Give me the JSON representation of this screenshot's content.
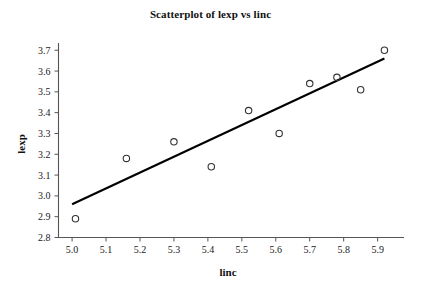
{
  "chart_data": {
    "type": "scatter",
    "title": "Scatterplot of lexp vs linc",
    "xlabel": "linc",
    "ylabel": "lexp",
    "xlim": [
      4.96,
      5.96
    ],
    "ylim": [
      2.8,
      3.73
    ],
    "grid": false,
    "legend": null,
    "xticks": [
      "5.0",
      "5.1",
      "5.2",
      "5.3",
      "5.4",
      "5.5",
      "5.6",
      "5.7",
      "5.8",
      "5.9"
    ],
    "xtick_values": [
      5.0,
      5.1,
      5.2,
      5.3,
      5.4,
      5.5,
      5.6,
      5.7,
      5.8,
      5.9
    ],
    "yticks": [
      "2.8",
      "2.9",
      "3.0",
      "3.1",
      "3.2",
      "3.3",
      "3.4",
      "3.5",
      "3.6",
      "3.7"
    ],
    "ytick_values": [
      2.8,
      2.9,
      3.0,
      3.1,
      3.2,
      3.3,
      3.4,
      3.5,
      3.6,
      3.7
    ],
    "marker": "open-circle",
    "marker_color": "#333333",
    "line_color": "#000000",
    "points": [
      {
        "x": 5.01,
        "y": 2.89
      },
      {
        "x": 5.16,
        "y": 3.18
      },
      {
        "x": 5.3,
        "y": 3.26
      },
      {
        "x": 5.41,
        "y": 3.14
      },
      {
        "x": 5.52,
        "y": 3.41
      },
      {
        "x": 5.61,
        "y": 3.3
      },
      {
        "x": 5.7,
        "y": 3.54
      },
      {
        "x": 5.78,
        "y": 3.57
      },
      {
        "x": 5.85,
        "y": 3.51
      },
      {
        "x": 5.92,
        "y": 3.7
      }
    ],
    "fit_line": {
      "x_start": 5.0,
      "y_start": 2.96,
      "x_end": 5.92,
      "y_end": 3.66
    }
  }
}
